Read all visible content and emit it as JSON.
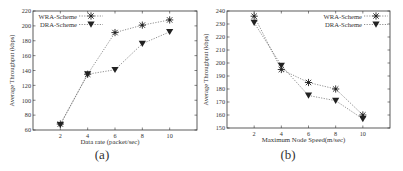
{
  "chart_data": [
    {
      "type": "line",
      "panel": "a",
      "caption": "(a)",
      "title": "",
      "xlabel": "Data rate (packet/sec)",
      "ylabel": "Average Throughput (kbps)",
      "x": [
        2,
        4,
        6,
        8,
        10
      ],
      "xticks": [
        2,
        4,
        6,
        8,
        10
      ],
      "xlim": [
        0,
        12
      ],
      "ylim": [
        60,
        220
      ],
      "yticks": [
        60,
        80,
        100,
        120,
        140,
        160,
        180,
        200,
        220
      ],
      "grid": false,
      "legend_position": "upper left",
      "series": [
        {
          "name": "WRA-Scheme",
          "marker": "asterisk",
          "line": "dotted",
          "values": [
            68,
            135,
            191,
            201,
            208
          ]
        },
        {
          "name": "DRA-Scheme",
          "marker": "triangle-down",
          "line": "dotted",
          "values": [
            67,
            135,
            141,
            176,
            192
          ]
        }
      ]
    },
    {
      "type": "line",
      "panel": "b",
      "caption": "(b)",
      "title": "",
      "xlabel": "Maximum Node Speed(m/sec)",
      "ylabel": "Average Throughput (kbps)",
      "x": [
        2,
        4,
        6,
        8,
        10
      ],
      "xticks": [
        2,
        4,
        6,
        8,
        10
      ],
      "xlim": [
        0,
        12
      ],
      "ylim": [
        150,
        240
      ],
      "yticks": [
        150,
        160,
        170,
        180,
        190,
        200,
        210,
        220,
        230,
        240
      ],
      "grid": false,
      "legend_position": "upper right",
      "series": [
        {
          "name": "WRA-Scheme",
          "marker": "asterisk",
          "line": "dotted",
          "values": [
            236,
            195,
            185,
            180,
            160
          ]
        },
        {
          "name": "DRA-Scheme",
          "marker": "triangle-down",
          "line": "dotted",
          "values": [
            231,
            198,
            175,
            171,
            157
          ]
        }
      ]
    }
  ],
  "colors": {
    "axis": "#333333",
    "line": "#444444",
    "marker": "#222222"
  }
}
